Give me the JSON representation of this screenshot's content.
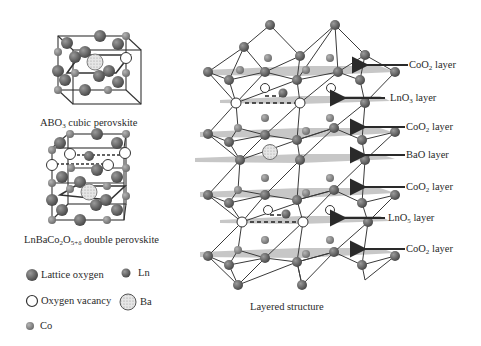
{
  "figure": {
    "panels": {
      "cubic": {
        "caption_main": "ABO",
        "caption_sub": "3",
        "caption_rest": " cubic perovskite"
      },
      "double": {
        "caption_main": "LnBaCo",
        "caption_sub1": "2",
        "caption_mid": "O",
        "caption_sub2": "5+δ",
        "caption_rest": " double perovskite"
      },
      "layered": {
        "caption": "Layered structure"
      }
    },
    "layer_labels": [
      {
        "main": "CoO",
        "sub": "2",
        "rest": " layer"
      },
      {
        "main": "LnO",
        "sub": "3",
        "rest": " layer"
      },
      {
        "main": "CoO",
        "sub": "2",
        "rest": " layer"
      },
      {
        "main": "BaO",
        "sub": "",
        "rest": " layer"
      },
      {
        "main": "CoO",
        "sub": "2",
        "rest": " layer"
      },
      {
        "main": "LnO",
        "sub": "5",
        "rest": " layer"
      },
      {
        "main": "CoO",
        "sub": "2",
        "rest": " layer"
      }
    ],
    "legend": [
      {
        "label": "Lattice oxygen",
        "symbol": "lattice-oxygen"
      },
      {
        "label": "Ln",
        "symbol": "ln"
      },
      {
        "label": "Oxygen vacancy",
        "symbol": "oxygen-vacancy"
      },
      {
        "label": "Ba",
        "symbol": "ba"
      },
      {
        "label": "Co",
        "symbol": "co"
      }
    ],
    "colors": {
      "oxygen": "#6a6a6a",
      "co": "#8a8a8a",
      "vacancy": "#ffffff",
      "ba": "#d8d8d8",
      "plane": "#b8b8b8",
      "bond": "#3a3a3a",
      "arrow": "#2a2a2a"
    }
  }
}
